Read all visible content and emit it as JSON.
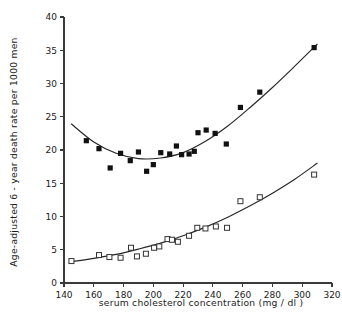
{
  "chart_data": {
    "type": "scatter",
    "title": "",
    "subtitle": "",
    "xlabel": "serum cholesterol concentration (mg / dl )",
    "ylabel": "Age-adjusted  6 - year  death  rate  per 1000 men",
    "xlim": [
      140,
      320
    ],
    "ylim": [
      0,
      40
    ],
    "xticks": [
      140,
      160,
      180,
      200,
      220,
      240,
      260,
      280,
      300,
      320
    ],
    "yticks": [
      0,
      5,
      10,
      15,
      20,
      25,
      30,
      35,
      40
    ],
    "xtick_labels": [
      "140",
      "160",
      "180",
      "200",
      "220",
      "240",
      "260",
      "280",
      "300",
      "320"
    ],
    "ytick_labels": [
      "0",
      "5",
      "10",
      "15",
      "20",
      "25",
      "30",
      "35",
      "40"
    ],
    "grid": false,
    "legend": "none",
    "series": [
      {
        "name": "filled-squares-upper",
        "marker": "filled-square",
        "color": "#111111",
        "points": [
          [
            155.0,
            21.4
          ],
          [
            163.5,
            20.2
          ],
          [
            171.0,
            17.3
          ],
          [
            178.0,
            19.5
          ],
          [
            184.5,
            18.4
          ],
          [
            190.0,
            19.7
          ],
          [
            195.5,
            16.8
          ],
          [
            200.0,
            17.8
          ],
          [
            205.0,
            19.6
          ],
          [
            211.0,
            19.4
          ],
          [
            215.5,
            20.6
          ],
          [
            219.0,
            19.3
          ],
          [
            224.0,
            19.4
          ],
          [
            227.5,
            19.8
          ],
          [
            230.0,
            22.6
          ],
          [
            235.5,
            23.0
          ],
          [
            241.5,
            22.5
          ],
          [
            249.0,
            20.9
          ],
          [
            258.5,
            26.4
          ],
          [
            271.5,
            28.7
          ],
          [
            308.0,
            35.4
          ]
        ],
        "fit_curve": [
          [
            145.0,
            23.9
          ],
          [
            160.0,
            21.2
          ],
          [
            175.0,
            19.5
          ],
          [
            190.0,
            18.7
          ],
          [
            205.0,
            18.8
          ],
          [
            220.0,
            19.6
          ],
          [
            235.0,
            21.3
          ],
          [
            250.0,
            23.6
          ],
          [
            265.0,
            26.4
          ],
          [
            280.0,
            29.4
          ],
          [
            295.0,
            32.6
          ],
          [
            310.0,
            35.9
          ]
        ]
      },
      {
        "name": "open-squares-lower",
        "marker": "open-square",
        "color": "#333333",
        "points": [
          [
            145.0,
            3.3
          ],
          [
            163.5,
            4.2
          ],
          [
            170.5,
            3.9
          ],
          [
            178.0,
            3.8
          ],
          [
            185.0,
            5.3
          ],
          [
            189.0,
            4.0
          ],
          [
            195.0,
            4.4
          ],
          [
            200.5,
            5.3
          ],
          [
            204.0,
            5.5
          ],
          [
            209.5,
            6.6
          ],
          [
            212.5,
            6.5
          ],
          [
            216.5,
            6.2
          ],
          [
            224.0,
            7.1
          ],
          [
            229.5,
            8.3
          ],
          [
            235.0,
            8.2
          ],
          [
            242.0,
            8.5
          ],
          [
            249.5,
            8.3
          ],
          [
            258.5,
            12.3
          ],
          [
            271.5,
            12.9
          ],
          [
            308.0,
            16.3
          ]
        ],
        "fit_curve": [
          [
            145.0,
            3.2
          ],
          [
            160.0,
            3.7
          ],
          [
            175.0,
            4.3
          ],
          [
            190.0,
            5.1
          ],
          [
            205.0,
            6.0
          ],
          [
            220.0,
            7.1
          ],
          [
            235.0,
            8.4
          ],
          [
            250.0,
            9.9
          ],
          [
            265.0,
            11.6
          ],
          [
            280.0,
            13.5
          ],
          [
            295.0,
            15.6
          ],
          [
            310.0,
            18.0
          ]
        ]
      }
    ]
  },
  "figure": {
    "background": "#ffffff",
    "axis_color": "#3a3a3a",
    "marker_filled_color": "#111111",
    "marker_open_color": "#333333",
    "curve_color": "#262626"
  }
}
